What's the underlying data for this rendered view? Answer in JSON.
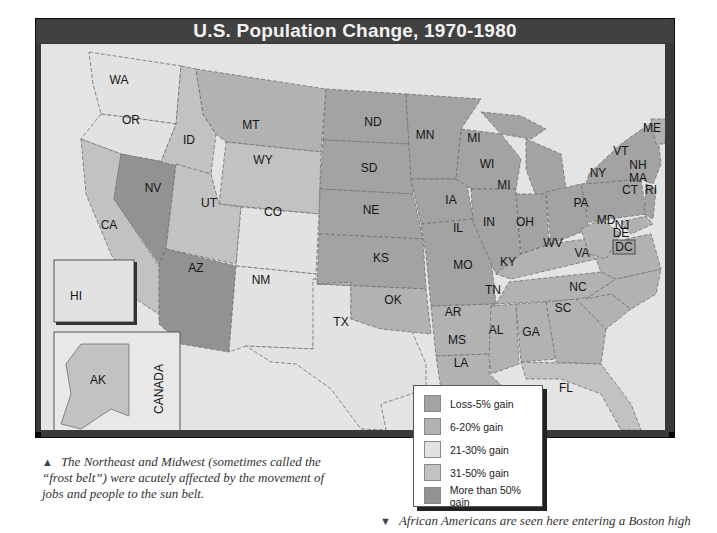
{
  "title": "U.S. Population Change, 1970-1980",
  "legend": {
    "items": [
      {
        "label": "Loss-5% gain",
        "color": "#a3a3a3"
      },
      {
        "label": "6-20% gain",
        "color": "#b2b2b2"
      },
      {
        "label": "21-30% gain",
        "color": "#e2e2e2"
      },
      {
        "label": "31-50% gain",
        "color": "#c2c2c2"
      },
      {
        "label": "More than 50% gain",
        "color": "#929292"
      }
    ]
  },
  "states": [
    {
      "abbr": "WA",
      "category": "21-30% gain"
    },
    {
      "abbr": "OR",
      "category": "21-30% gain"
    },
    {
      "abbr": "CA",
      "category": "6-20% gain"
    },
    {
      "abbr": "NV",
      "category": "More than 50% gain"
    },
    {
      "abbr": "ID",
      "category": "31-50% gain"
    },
    {
      "abbr": "MT",
      "category": "6-20% gain"
    },
    {
      "abbr": "WY",
      "category": "31-50% gain"
    },
    {
      "abbr": "UT",
      "category": "31-50% gain"
    },
    {
      "abbr": "CO",
      "category": "21-30% gain"
    },
    {
      "abbr": "AZ",
      "category": "More than 50% gain"
    },
    {
      "abbr": "NM",
      "category": "21-30% gain"
    },
    {
      "abbr": "TX",
      "category": "21-30% gain"
    },
    {
      "abbr": "ND",
      "category": "Loss-5% gain"
    },
    {
      "abbr": "SD",
      "category": "Loss-5% gain"
    },
    {
      "abbr": "NE",
      "category": "Loss-5% gain"
    },
    {
      "abbr": "KS",
      "category": "Loss-5% gain"
    },
    {
      "abbr": "OK",
      "category": "6-20% gain"
    },
    {
      "abbr": "MN",
      "category": "Loss-5% gain"
    },
    {
      "abbr": "IA",
      "category": "Loss-5% gain"
    },
    {
      "abbr": "MO",
      "category": "Loss-5% gain"
    },
    {
      "abbr": "AR",
      "category": "6-20% gain"
    },
    {
      "abbr": "LA",
      "category": "6-20% gain"
    },
    {
      "abbr": "WI",
      "category": "Loss-5% gain"
    },
    {
      "abbr": "IL",
      "category": "Loss-5% gain"
    },
    {
      "abbr": "MI",
      "category": "Loss-5% gain"
    },
    {
      "abbr": "IN",
      "category": "Loss-5% gain"
    },
    {
      "abbr": "OH",
      "category": "Loss-5% gain"
    },
    {
      "abbr": "KY",
      "category": "6-20% gain"
    },
    {
      "abbr": "TN",
      "category": "6-20% gain"
    },
    {
      "abbr": "MS",
      "category": "6-20% gain"
    },
    {
      "abbr": "AL",
      "category": "6-20% gain"
    },
    {
      "abbr": "GA",
      "category": "6-20% gain"
    },
    {
      "abbr": "FL",
      "category": "31-50% gain"
    },
    {
      "abbr": "SC",
      "category": "6-20% gain"
    },
    {
      "abbr": "NC",
      "category": "6-20% gain"
    },
    {
      "abbr": "VA",
      "category": "6-20% gain"
    },
    {
      "abbr": "WV",
      "category": "6-20% gain"
    },
    {
      "abbr": "PA",
      "category": "Loss-5% gain"
    },
    {
      "abbr": "NY",
      "category": "Loss-5% gain"
    },
    {
      "abbr": "VT",
      "category": "6-20% gain"
    },
    {
      "abbr": "NH",
      "category": "21-30% gain"
    },
    {
      "abbr": "ME",
      "category": "6-20% gain"
    },
    {
      "abbr": "MA",
      "category": "Loss-5% gain"
    },
    {
      "abbr": "RI",
      "category": "Loss-5% gain"
    },
    {
      "abbr": "CT",
      "category": "Loss-5% gain"
    },
    {
      "abbr": "NJ",
      "category": "Loss-5% gain"
    },
    {
      "abbr": "DE",
      "category": "6-20% gain"
    },
    {
      "abbr": "MD",
      "category": "6-20% gain"
    },
    {
      "abbr": "DC",
      "category": "Loss-5% gain"
    },
    {
      "abbr": "HI",
      "category": "21-30% gain"
    },
    {
      "abbr": "AK",
      "category": "31-50% gain"
    }
  ],
  "inset_labels": {
    "hawaii": "HI",
    "alaska": "AK",
    "canada": "CANADA"
  },
  "captions": {
    "top_left": "The Northeast and Midwest (sometimes called the “frost belt”) were acutely affected by the movement of jobs and people to the sun belt.",
    "bottom_right": "African Americans are seen here entering a Boston high"
  },
  "caption_markers": {
    "up": "▲",
    "down": "▼"
  }
}
